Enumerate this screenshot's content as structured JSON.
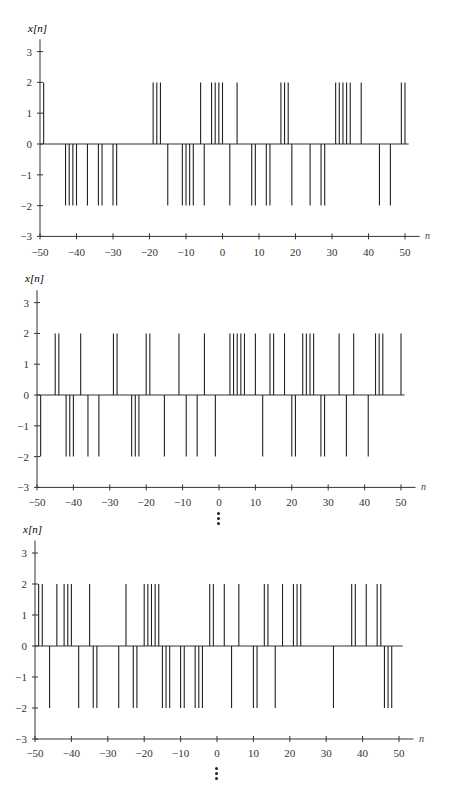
{
  "figure": {
    "ylabel": "x[n]",
    "xlabel": "n",
    "continuation_marker": "⋮"
  },
  "chart_data": [
    {
      "type": "stem",
      "title": "",
      "xlabel": "n",
      "ylabel": "x[n]",
      "xlim": [
        -50,
        50
      ],
      "ylim": [
        -3,
        3
      ],
      "xticks": [
        -50,
        -40,
        -30,
        -20,
        -10,
        0,
        10,
        20,
        30,
        40,
        50
      ],
      "yticks": [
        -3,
        -2,
        -1,
        0,
        1,
        2,
        3
      ],
      "grid": false,
      "positive_n": [
        -49,
        -19,
        -18,
        -17,
        -6,
        -3,
        -2,
        -1,
        0,
        4,
        16,
        17,
        18,
        31,
        32,
        33,
        34,
        35,
        38,
        49,
        50
      ],
      "negative_n": [
        -43,
        -42,
        -41,
        -40,
        -37,
        -34,
        -33,
        -30,
        -29,
        -15,
        -11,
        -10,
        -9,
        -8,
        -5,
        2,
        8,
        9,
        12,
        13,
        19,
        24,
        27,
        28,
        43,
        46
      ],
      "amplitude": 2
    },
    {
      "type": "stem",
      "title": "",
      "xlabel": "n",
      "ylabel": "x[n]",
      "xlim": [
        -50,
        50
      ],
      "ylim": [
        -3,
        3
      ],
      "xticks": [
        -50,
        -40,
        -30,
        -20,
        -10,
        0,
        10,
        20,
        30,
        40,
        50
      ],
      "yticks": [
        -3,
        -2,
        -1,
        0,
        1,
        2,
        3
      ],
      "grid": false,
      "positive_n": [
        -45,
        -44,
        -38,
        -29,
        -28,
        -20,
        -19,
        -11,
        -4,
        3,
        4,
        5,
        6,
        7,
        10,
        14,
        15,
        18,
        23,
        24,
        25,
        26,
        33,
        37,
        43,
        44,
        45,
        50
      ],
      "negative_n": [
        -49,
        -42,
        -41,
        -40,
        -36,
        -33,
        -24,
        -23,
        -22,
        -15,
        -9,
        -6,
        -1,
        12,
        20,
        21,
        28,
        29,
        35,
        41
      ],
      "amplitude": 2
    },
    {
      "type": "stem",
      "title": "",
      "xlabel": "n",
      "ylabel": "x[n]",
      "xlim": [
        -50,
        50
      ],
      "ylim": [
        -3,
        3
      ],
      "xticks": [
        -50,
        -40,
        -30,
        -20,
        -10,
        0,
        10,
        20,
        30,
        40,
        50
      ],
      "yticks": [
        -3,
        -2,
        -1,
        0,
        1,
        2,
        3
      ],
      "grid": false,
      "positive_n": [
        -49,
        -48,
        -44,
        -42,
        -41,
        -40,
        -35,
        -25,
        -20,
        -19,
        -18,
        -17,
        -16,
        -2,
        -1,
        2,
        6,
        13,
        14,
        18,
        21,
        22,
        23,
        37,
        38,
        41,
        44,
        45
      ],
      "negative_n": [
        -46,
        -38,
        -34,
        -33,
        -27,
        -23,
        -22,
        -15,
        -14,
        -13,
        -10,
        -9,
        -6,
        -5,
        -4,
        4,
        10,
        11,
        16,
        32,
        46,
        47,
        48
      ],
      "amplitude": 2
    }
  ],
  "layout": {
    "plots": [
      {
        "top": 22,
        "x0": 40,
        "x1": 405,
        "y_zero": 122,
        "y_unit": 30.8,
        "ylabel_y": 10,
        "tick_label_y": 234
      },
      {
        "top": 270,
        "x0": 37,
        "x1": 401,
        "y_zero": 125,
        "y_unit": 30.8,
        "ylabel_y": 12,
        "tick_label_y": 236
      },
      {
        "top": 525,
        "x0": 35,
        "x1": 399,
        "y_zero": 121,
        "y_unit": 31.0,
        "ylabel_y": 8,
        "tick_label_y": 232
      }
    ],
    "dots": [
      {
        "left": 215,
        "top": 510
      },
      {
        "left": 213,
        "top": 763
      }
    ]
  }
}
